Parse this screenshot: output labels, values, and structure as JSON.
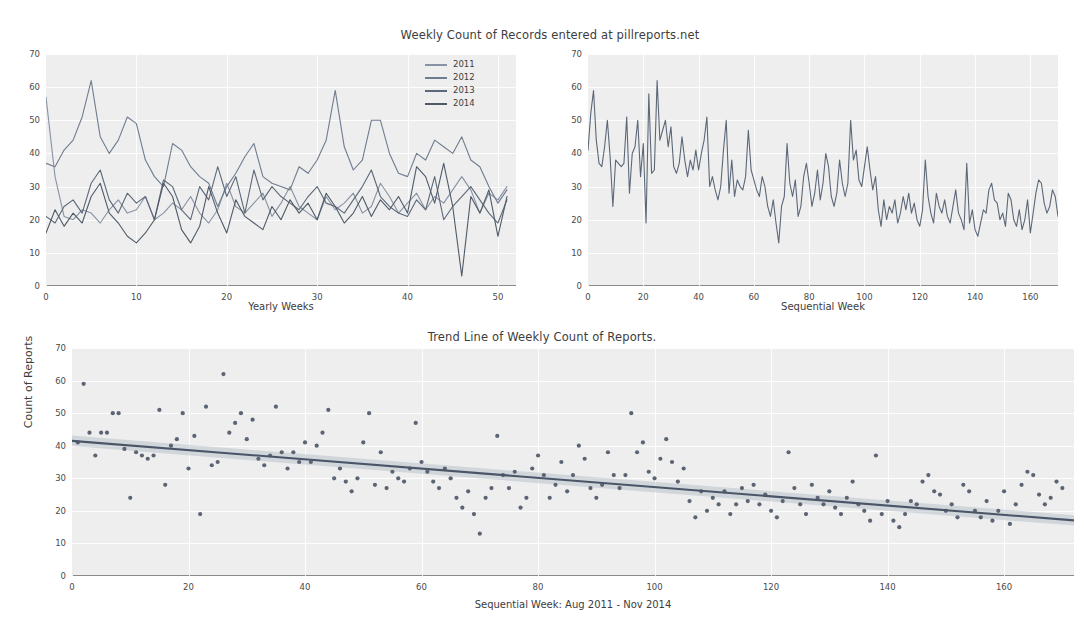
{
  "figure": {
    "suptitle": "Weekly Count of Records entered at pillreports.net"
  },
  "chart_data": [
    {
      "id": "yearly-overlay",
      "type": "line",
      "title": "Weekly Count of Records entered at pillreports.net",
      "xlabel": "Yearly Weeks",
      "ylabel": "",
      "xlim": [
        0,
        52
      ],
      "ylim": [
        0,
        70
      ],
      "xticks": [
        0,
        10,
        20,
        30,
        40,
        50
      ],
      "yticks": [
        0,
        10,
        20,
        30,
        40,
        50,
        60,
        70
      ],
      "grid": true,
      "legend": [
        "2011",
        "2012",
        "2013",
        "2014"
      ],
      "legend_position": "upper right",
      "colors": [
        "#8792a2",
        "#6f7c8f",
        "#5c6878",
        "#4f5a68"
      ],
      "series": [
        {
          "name": "2011",
          "color": "#8792a2",
          "values": [
            57,
            33,
            21,
            20,
            23,
            22,
            19,
            23,
            26,
            22,
            23,
            27,
            20,
            22,
            25,
            23,
            27,
            22,
            19,
            23,
            31,
            24,
            22,
            25,
            28,
            21,
            25,
            30,
            24,
            22,
            20,
            27,
            23,
            25,
            28,
            22,
            24,
            31,
            27,
            22,
            25,
            28,
            23,
            27,
            25,
            29,
            33,
            29,
            22,
            28,
            26,
            30
          ]
        },
        {
          "name": "2012",
          "color": "#6f7c8f",
          "values": [
            37,
            36,
            41,
            44,
            51,
            62,
            45,
            40,
            44,
            51,
            49,
            38,
            33,
            30,
            43,
            41,
            36,
            33,
            31,
            24,
            30,
            34,
            39,
            43,
            33,
            31,
            30,
            29,
            36,
            34,
            38,
            44,
            59,
            42,
            35,
            38,
            50,
            50,
            40,
            34,
            33,
            40,
            38,
            44,
            42,
            40,
            45,
            38,
            36,
            30,
            25,
            29
          ]
        },
        {
          "name": "2013",
          "color": "#5c6878",
          "values": [
            21,
            19,
            24,
            26,
            22,
            31,
            35,
            26,
            22,
            28,
            25,
            27,
            20,
            32,
            30,
            23,
            20,
            30,
            26,
            36,
            27,
            33,
            22,
            35,
            26,
            30,
            27,
            25,
            23,
            27,
            30,
            25,
            24,
            22,
            26,
            30,
            35,
            27,
            24,
            22,
            21,
            26,
            23,
            33,
            20,
            24,
            27,
            30,
            26,
            22,
            19,
            26
          ]
        },
        {
          "name": "2014",
          "color": "#4f5a68",
          "values": [
            16,
            23,
            18,
            22,
            19,
            27,
            31,
            22,
            19,
            15,
            13,
            16,
            20,
            31,
            27,
            17,
            13,
            18,
            30,
            22,
            16,
            26,
            21,
            19,
            17,
            24,
            20,
            26,
            22,
            25,
            20,
            28,
            24,
            19,
            22,
            27,
            21,
            26,
            23,
            27,
            22,
            36,
            33,
            25,
            37,
            24,
            3,
            27,
            22,
            29,
            15,
            27
          ]
        }
      ]
    },
    {
      "id": "sequential-series",
      "type": "line",
      "title": "",
      "xlabel": "Sequential Week",
      "ylabel": "",
      "xlim": [
        0,
        170
      ],
      "ylim": [
        0,
        70
      ],
      "xticks": [
        0,
        20,
        40,
        60,
        80,
        100,
        120,
        140,
        160
      ],
      "yticks": [
        0,
        10,
        20,
        30,
        40,
        50,
        60,
        70
      ],
      "grid": true,
      "color": "#5c6878",
      "values": [
        41,
        52,
        59,
        44,
        37,
        36,
        42,
        50,
        39,
        24,
        38,
        37,
        36,
        37,
        51,
        28,
        40,
        42,
        50,
        33,
        43,
        19,
        58,
        34,
        35,
        62,
        44,
        47,
        50,
        42,
        48,
        36,
        34,
        37,
        45,
        38,
        33,
        38,
        35,
        41,
        35,
        40,
        44,
        51,
        30,
        33,
        29,
        26,
        30,
        41,
        50,
        28,
        38,
        27,
        32,
        30,
        29,
        33,
        47,
        35,
        32,
        29,
        27,
        33,
        30,
        24,
        21,
        26,
        19,
        13,
        24,
        27,
        43,
        31,
        27,
        32,
        21,
        24,
        33,
        37,
        31,
        24,
        28,
        35,
        26,
        31,
        40,
        36,
        27,
        24,
        28,
        38,
        31,
        27,
        31,
        50,
        38,
        41,
        32,
        30,
        36,
        42,
        35,
        29,
        33,
        23,
        18,
        26,
        20,
        24,
        22,
        26,
        19,
        22,
        27,
        23,
        28,
        22,
        25,
        20,
        18,
        23,
        38,
        27,
        22,
        19,
        28,
        24,
        22,
        26,
        21,
        19,
        24,
        29,
        22,
        20,
        17,
        37,
        19,
        23,
        17,
        15,
        19,
        23,
        22,
        29,
        31,
        26,
        25,
        20,
        22,
        18,
        28,
        26,
        20,
        18,
        23,
        17,
        20,
        26,
        16,
        22,
        28,
        32,
        31,
        25,
        22,
        24,
        29,
        27,
        21,
        25
      ]
    },
    {
      "id": "trend-scatter",
      "type": "scatter",
      "title": "Trend Line of Weekly Count of Reports.",
      "xlabel": "Sequential Week: Aug 2011 - Nov 2014",
      "ylabel": "Count of Reports",
      "xlim": [
        0,
        172
      ],
      "ylim": [
        0,
        70
      ],
      "xticks": [
        0,
        20,
        40,
        60,
        80,
        100,
        120,
        140,
        160
      ],
      "yticks": [
        0,
        10,
        20,
        30,
        40,
        50,
        60,
        70
      ],
      "grid": true,
      "point_color": "#5b6472",
      "line_color": "#4a5568",
      "band_color": "#b9c2cc",
      "trend": {
        "intercept": 41.5,
        "slope": -0.142,
        "band_halfwidth": 1.6
      },
      "x": [
        1,
        2,
        3,
        4,
        5,
        6,
        7,
        8,
        9,
        10,
        11,
        12,
        13,
        14,
        15,
        16,
        17,
        18,
        19,
        20,
        21,
        22,
        23,
        24,
        25,
        26,
        27,
        28,
        29,
        30,
        31,
        32,
        33,
        34,
        35,
        36,
        37,
        38,
        39,
        40,
        41,
        42,
        43,
        44,
        45,
        46,
        47,
        48,
        49,
        50,
        51,
        52,
        53,
        54,
        55,
        56,
        57,
        58,
        59,
        60,
        61,
        62,
        63,
        64,
        65,
        66,
        67,
        68,
        69,
        70,
        71,
        72,
        73,
        74,
        75,
        76,
        77,
        78,
        79,
        80,
        81,
        82,
        83,
        84,
        85,
        86,
        87,
        88,
        89,
        90,
        91,
        92,
        93,
        94,
        95,
        96,
        97,
        98,
        99,
        100,
        101,
        102,
        103,
        104,
        105,
        106,
        107,
        108,
        109,
        110,
        111,
        112,
        113,
        114,
        115,
        116,
        117,
        118,
        119,
        120,
        121,
        122,
        123,
        124,
        125,
        126,
        127,
        128,
        129,
        130,
        131,
        132,
        133,
        134,
        135,
        136,
        137,
        138,
        139,
        140,
        141,
        142,
        143,
        144,
        145,
        146,
        147,
        148,
        149,
        150,
        151,
        152,
        153,
        154,
        155,
        156,
        157,
        158,
        159,
        160,
        161,
        162,
        163,
        164,
        165,
        166,
        167,
        168,
        169,
        170
      ],
      "y": [
        41,
        59,
        44,
        37,
        44,
        44,
        50,
        50,
        39,
        24,
        38,
        37,
        36,
        37,
        51,
        28,
        40,
        42,
        50,
        33,
        43,
        19,
        52,
        34,
        35,
        62,
        44,
        47,
        50,
        42,
        48,
        36,
        34,
        37,
        52,
        38,
        33,
        38,
        35,
        41,
        35,
        40,
        44,
        51,
        30,
        33,
        29,
        26,
        30,
        41,
        50,
        28,
        38,
        27,
        32,
        30,
        29,
        33,
        47,
        35,
        32,
        29,
        27,
        33,
        30,
        24,
        21,
        26,
        19,
        13,
        24,
        27,
        43,
        31,
        27,
        32,
        21,
        24,
        33,
        37,
        31,
        24,
        28,
        35,
        26,
        31,
        40,
        36,
        27,
        24,
        28,
        38,
        31,
        27,
        31,
        50,
        38,
        41,
        32,
        30,
        36,
        42,
        35,
        29,
        33,
        23,
        18,
        26,
        20,
        24,
        22,
        26,
        19,
        22,
        27,
        23,
        28,
        22,
        25,
        20,
        18,
        23,
        38,
        27,
        22,
        19,
        28,
        24,
        22,
        26,
        21,
        19,
        24,
        29,
        22,
        20,
        17,
        37,
        19,
        23,
        17,
        15,
        19,
        23,
        22,
        29,
        31,
        26,
        25,
        20,
        22,
        18,
        28,
        26,
        20,
        18,
        23,
        17,
        20,
        26,
        16,
        22,
        28,
        32,
        31,
        25,
        22,
        24,
        29,
        27,
        21,
        25
      ]
    }
  ]
}
